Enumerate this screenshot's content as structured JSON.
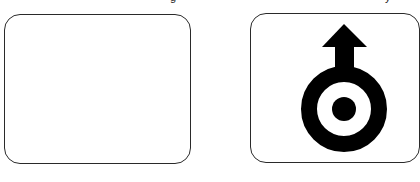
{
  "cards": [
    {
      "id": "left",
      "content": "empty",
      "icon": null
    },
    {
      "id": "right",
      "content": "symbol",
      "icon": "up-arrow-on-ring-with-dot-icon"
    }
  ],
  "captions": {
    "left": "g",
    "right": "y"
  },
  "colors": {
    "border": "#2a2a2a",
    "symbol": "#000000",
    "background": "#ffffff"
  }
}
